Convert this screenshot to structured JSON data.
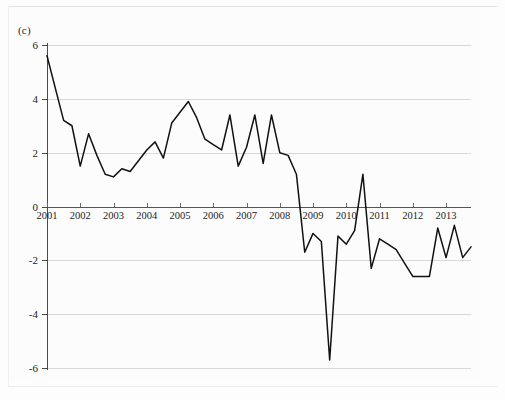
{
  "panel": {
    "label": "(c)"
  },
  "chart_data": {
    "type": "line",
    "title": "",
    "subtitle": "",
    "xlabel": "",
    "ylabel": "",
    "grid": true,
    "legend": "none",
    "legend_entries": [],
    "annotations": [],
    "line_color": "#111111",
    "ylim": [
      -6,
      6
    ],
    "ytick_values": [
      6,
      4,
      2,
      0,
      -2,
      -4,
      -6
    ],
    "ytick_labels": [
      "6",
      "4",
      "2",
      "0",
      "-2",
      "-4",
      "-6"
    ],
    "xlim": [
      "2001 Q1",
      "2013 Q4"
    ],
    "xtick_labels": [
      "2001",
      "2002",
      "2003",
      "2004",
      "2005",
      "2006",
      "2007",
      "2008",
      "2009",
      "2010",
      "2011",
      "2012",
      "2013"
    ],
    "x": [
      "2001Q1",
      "2001Q2",
      "2001Q3",
      "2001Q4",
      "2002Q1",
      "2002Q2",
      "2002Q3",
      "2002Q4",
      "2003Q1",
      "2003Q2",
      "2003Q3",
      "2003Q4",
      "2004Q1",
      "2004Q2",
      "2004Q3",
      "2004Q4",
      "2005Q1",
      "2005Q2",
      "2005Q3",
      "2005Q4",
      "2006Q1",
      "2006Q2",
      "2006Q3",
      "2006Q4",
      "2007Q1",
      "2007Q2",
      "2007Q3",
      "2007Q4",
      "2008Q1",
      "2008Q2",
      "2008Q3",
      "2008Q4",
      "2009Q1",
      "2009Q2",
      "2009Q3",
      "2009Q4",
      "2010Q1",
      "2010Q2",
      "2010Q3",
      "2010Q4",
      "2011Q1",
      "2011Q2",
      "2011Q3",
      "2011Q4",
      "2012Q1",
      "2012Q2",
      "2012Q3",
      "2012Q4",
      "2013Q1",
      "2013Q2",
      "2013Q3",
      "2013Q4"
    ],
    "values": [
      5.6,
      4.4,
      3.2,
      3.0,
      1.5,
      2.7,
      1.9,
      1.2,
      1.1,
      1.4,
      1.3,
      1.7,
      2.1,
      2.4,
      1.8,
      3.1,
      3.5,
      3.9,
      3.3,
      2.5,
      2.3,
      2.1,
      3.4,
      1.5,
      2.2,
      3.4,
      1.6,
      3.4,
      2.0,
      1.9,
      1.2,
      -1.7,
      -1.0,
      -1.3,
      -5.7,
      -1.1,
      -1.4,
      -0.9,
      1.2,
      -2.3,
      -1.2,
      -1.4,
      -1.6,
      -2.1,
      -2.6,
      -2.6,
      -2.6,
      -0.8,
      -1.9,
      -0.7,
      -1.9,
      -1.5
    ]
  }
}
